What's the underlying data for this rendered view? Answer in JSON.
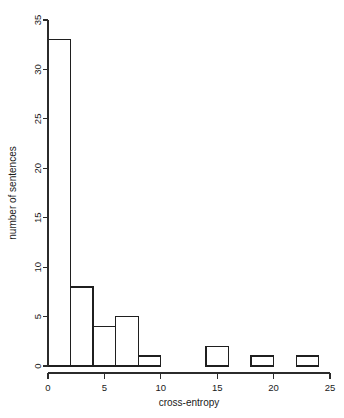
{
  "chart_data": {
    "type": "bar",
    "title": "",
    "subtitle": "",
    "xlabel": "cross-entropy",
    "ylabel": "number of sentences",
    "xlim": [
      0,
      25
    ],
    "ylim": [
      0,
      35
    ],
    "xticks": [
      "0",
      "5",
      "10",
      "15",
      "20",
      "25"
    ],
    "xtick_values": [
      0,
      5,
      10,
      15,
      20,
      25
    ],
    "yticks": [
      "0",
      "5",
      "10",
      "15",
      "20",
      "25",
      "30",
      "35"
    ],
    "ytick_values": [
      0,
      5,
      10,
      15,
      20,
      25,
      30,
      35
    ],
    "bin_width": 2,
    "bin_edges": [
      0,
      2,
      4,
      6,
      8,
      10,
      12,
      14,
      16,
      18,
      20,
      22,
      24
    ],
    "categories": [
      "0-2",
      "2-4",
      "4-6",
      "6-8",
      "8-10",
      "10-12",
      "12-14",
      "14-16",
      "16-18",
      "18-20",
      "20-22",
      "22-24"
    ],
    "values": [
      33,
      8,
      4,
      5,
      1,
      0,
      0,
      2,
      0,
      1,
      0,
      1
    ],
    "bars": [
      {
        "x0": 0,
        "x1": 2,
        "value": 33
      },
      {
        "x0": 2,
        "x1": 4,
        "value": 8
      },
      {
        "x0": 4,
        "x1": 6,
        "value": 4
      },
      {
        "x0": 6,
        "x1": 8,
        "value": 5
      },
      {
        "x0": 8,
        "x1": 10,
        "value": 1
      },
      {
        "x0": 10,
        "x1": 12,
        "value": 0
      },
      {
        "x0": 12,
        "x1": 14,
        "value": 0
      },
      {
        "x0": 14,
        "x1": 16,
        "value": 2
      },
      {
        "x0": 16,
        "x1": 18,
        "value": 0
      },
      {
        "x0": 18,
        "x1": 20,
        "value": 1
      },
      {
        "x0": 20,
        "x1": 22,
        "value": 0
      },
      {
        "x0": 22,
        "x1": 24,
        "value": 1
      }
    ],
    "grid": false,
    "legend": null,
    "colors": {
      "background": "#ffffff",
      "bar_stroke": "#1f1f1f",
      "bar_fill": "none",
      "axis": "#2b2b2b",
      "text": "#1a1a1a"
    }
  }
}
